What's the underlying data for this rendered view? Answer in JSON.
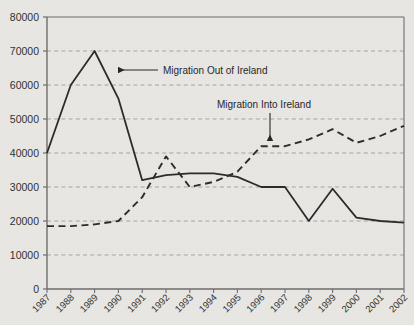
{
  "chart_data": {
    "type": "line",
    "title": "",
    "xlabel": "",
    "ylabel": "",
    "grid": true,
    "legend_position": "inline-annotations",
    "ylim": [
      0,
      80000
    ],
    "ytick_step": 10000,
    "yticks": [
      "0",
      "10000",
      "20000",
      "30000",
      "40000",
      "50000",
      "60000",
      "70000",
      "80000"
    ],
    "categories": [
      "1987",
      "1988",
      "1989",
      "1990",
      "1991",
      "1992",
      "1993",
      "1994",
      "1995",
      "1996",
      "1997",
      "1998",
      "1999",
      "2000",
      "2001",
      "2002"
    ],
    "series": [
      {
        "name": "Migration Out of Ireland",
        "style": "solid",
        "color": "#2b2b2b",
        "values": [
          40000,
          60000,
          70000,
          56000,
          32000,
          33500,
          34000,
          34000,
          33000,
          30000,
          30000,
          20000,
          29500,
          21000,
          20000,
          19500
        ]
      },
      {
        "name": "Migration Into Ireland",
        "style": "dashed",
        "color": "#2b2b2b",
        "values": [
          18500,
          18500,
          19000,
          20000,
          27000,
          39000,
          30000,
          31500,
          34500,
          42000,
          42000,
          44000,
          47000,
          43000,
          45000,
          48000
        ]
      }
    ],
    "annotations": [
      {
        "name": "migration-out-annotation",
        "text": "Migration Out of Ireland",
        "arrow": "left",
        "text_x": 163,
        "text_y": 74,
        "arrow_from_x": 158,
        "arrow_from_y": 70,
        "arrow_to_x": 118,
        "arrow_to_y": 70
      },
      {
        "name": "migration-into-annotation",
        "text": "Migration Into Ireland",
        "arrow": "down",
        "text_x": 217,
        "text_y": 108,
        "arrow_from_x": 270,
        "arrow_from_y": 113,
        "arrow_to_x": 270,
        "arrow_to_y": 141
      }
    ]
  },
  "colors": {
    "background": "#e9e7e3",
    "axis": "#6d6d6d",
    "gridline": "#9a9a9a",
    "text": "#2f2f2f",
    "series": "#2b2b2b"
  }
}
